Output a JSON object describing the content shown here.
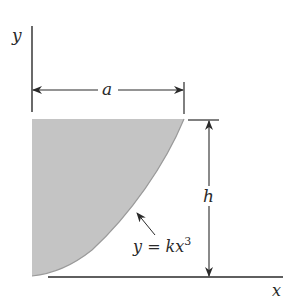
{
  "diagram": {
    "labels": {
      "y_axis": "y",
      "x_axis": "x",
      "width": "a",
      "height": "h",
      "curve_eq_prefix": "y = kx",
      "curve_eq_exponent": "3"
    },
    "colors": {
      "shade": "#c4c4c4",
      "curve": "#9a9a9a",
      "line": "#2a2a2a",
      "background": "#ffffff"
    }
  }
}
